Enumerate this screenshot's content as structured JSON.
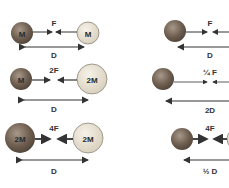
{
  "diagram": {
    "colors": {
      "planet_dark": "#7a6a5a",
      "planet_light": "#e8e2d4",
      "line": "#333333",
      "outline": "#8a8478"
    },
    "left_column": [
      {
        "mass_a": "M",
        "mass_b": "M",
        "force": "F",
        "distance": "D"
      },
      {
        "mass_a": "M",
        "mass_b": "2M",
        "force": "2F",
        "distance": "D"
      },
      {
        "mass_a": "2M",
        "mass_b": "2M",
        "force": "4F",
        "distance": "D"
      }
    ],
    "right_column": [
      {
        "force": "F",
        "distance": "D"
      },
      {
        "force": "¼ F",
        "distance": "2D"
      },
      {
        "force": "4F",
        "distance": "½ D"
      }
    ]
  }
}
